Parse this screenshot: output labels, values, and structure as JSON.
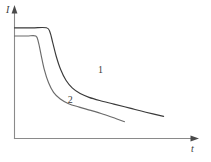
{
  "figure": {
    "background_color": "#ffffff",
    "axis_color": "#8a8a8a",
    "curve_color": "#3a3a3a",
    "curve2_color": "#6b6b6b"
  },
  "chart_data": {
    "type": "line",
    "title": "",
    "subtitle": "",
    "xlabel": "t",
    "ylabel": "I",
    "xlim": [
      0,
      1
    ],
    "ylim": [
      0,
      1
    ],
    "grid": false,
    "legend_position": "inline-annotation",
    "axis_ticks": {
      "x": [],
      "y": []
    },
    "annotations": [
      {
        "text": "1",
        "x": 0.47,
        "y": 0.52
      },
      {
        "text": "2",
        "x": 0.3,
        "y": 0.28
      }
    ],
    "series": [
      {
        "name": "1",
        "label": "1",
        "description": "upper decay curve with higher initial plateau",
        "points": [
          {
            "x": 0.0,
            "y": 0.875
          },
          {
            "x": 0.1,
            "y": 0.875
          },
          {
            "x": 0.18,
            "y": 0.875
          },
          {
            "x": 0.2,
            "y": 0.84
          },
          {
            "x": 0.215,
            "y": 0.76
          },
          {
            "x": 0.235,
            "y": 0.65
          },
          {
            "x": 0.26,
            "y": 0.545
          },
          {
            "x": 0.29,
            "y": 0.46
          },
          {
            "x": 0.325,
            "y": 0.4
          },
          {
            "x": 0.37,
            "y": 0.355
          },
          {
            "x": 0.42,
            "y": 0.325
          },
          {
            "x": 0.48,
            "y": 0.3
          },
          {
            "x": 0.56,
            "y": 0.272
          },
          {
            "x": 0.65,
            "y": 0.24
          },
          {
            "x": 0.74,
            "y": 0.208
          },
          {
            "x": 0.84,
            "y": 0.175
          }
        ]
      },
      {
        "name": "2",
        "label": "2",
        "description": "lower decay curve with lower initial plateau and earlier break",
        "points": [
          {
            "x": 0.0,
            "y": 0.81
          },
          {
            "x": 0.07,
            "y": 0.81
          },
          {
            "x": 0.12,
            "y": 0.81
          },
          {
            "x": 0.135,
            "y": 0.76
          },
          {
            "x": 0.15,
            "y": 0.66
          },
          {
            "x": 0.168,
            "y": 0.545
          },
          {
            "x": 0.192,
            "y": 0.44
          },
          {
            "x": 0.22,
            "y": 0.365
          },
          {
            "x": 0.258,
            "y": 0.312
          },
          {
            "x": 0.305,
            "y": 0.275
          },
          {
            "x": 0.365,
            "y": 0.248
          },
          {
            "x": 0.43,
            "y": 0.222
          },
          {
            "x": 0.5,
            "y": 0.192
          },
          {
            "x": 0.57,
            "y": 0.158
          },
          {
            "x": 0.62,
            "y": 0.133
          }
        ]
      }
    ]
  }
}
